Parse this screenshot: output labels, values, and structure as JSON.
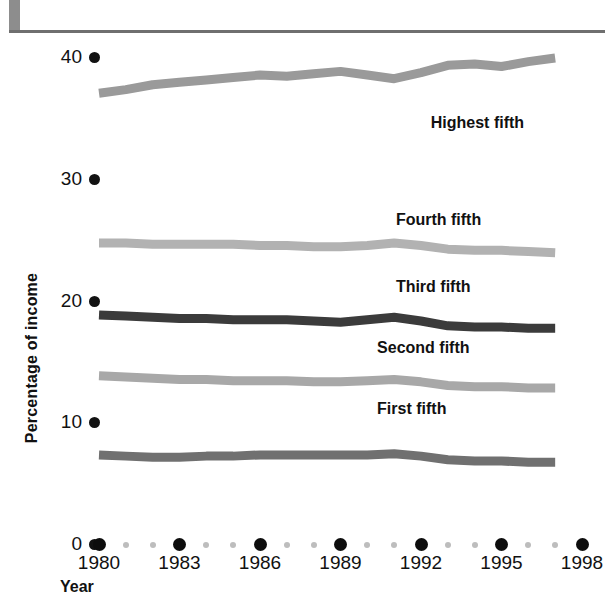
{
  "header": {
    "title": "Income: 1980–1997",
    "accent_color": "#8d8d8d",
    "rule_color": "#6f6f6f"
  },
  "chart_data": {
    "type": "line",
    "title": "Income: 1980–1997",
    "xlabel": "Year",
    "ylabel": "Percentage of income",
    "xlim": [
      1980,
      1998
    ],
    "ylim": [
      0,
      40
    ],
    "grid": false,
    "legend_position": "inline-right",
    "x": [
      1980,
      1981,
      1982,
      1983,
      1984,
      1985,
      1986,
      1987,
      1988,
      1989,
      1990,
      1991,
      1992,
      1993,
      1994,
      1995,
      1996,
      1997
    ],
    "xticks": [
      1980,
      1983,
      1986,
      1989,
      1992,
      1995,
      1998
    ],
    "xticks_minor": [
      1981,
      1982,
      1984,
      1985,
      1987,
      1988,
      1990,
      1991,
      1993,
      1994,
      1996,
      1997
    ],
    "yticks": [
      0,
      10,
      20,
      30,
      40
    ],
    "series": [
      {
        "name": "Highest fifth",
        "color": "#9a9a9a",
        "label_x": 1994.6,
        "label_y": 34.6,
        "values": [
          37.1,
          37.4,
          37.8,
          38.0,
          38.2,
          38.4,
          38.6,
          38.5,
          38.7,
          38.9,
          38.6,
          38.3,
          38.8,
          39.4,
          39.5,
          39.3,
          39.7,
          40.0
        ]
      },
      {
        "name": "Fourth fifth",
        "color": "#b2b2b2",
        "label_x": 1993.3,
        "label_y": 26.6,
        "values": [
          24.8,
          24.8,
          24.7,
          24.7,
          24.7,
          24.7,
          24.6,
          24.6,
          24.5,
          24.5,
          24.6,
          24.8,
          24.6,
          24.3,
          24.2,
          24.2,
          24.1,
          24.0
        ]
      },
      {
        "name": "Third fifth",
        "color": "#3b3b3b",
        "label_x": 1993.3,
        "label_y": 21.1,
        "values": [
          18.9,
          18.8,
          18.7,
          18.6,
          18.6,
          18.5,
          18.5,
          18.5,
          18.4,
          18.3,
          18.5,
          18.7,
          18.4,
          18.0,
          17.9,
          17.9,
          17.8,
          17.8
        ]
      },
      {
        "name": "Second fifth",
        "color": "#a8a8a8",
        "label_x": 1992.6,
        "label_y": 16.1,
        "values": [
          13.9,
          13.8,
          13.7,
          13.6,
          13.6,
          13.5,
          13.5,
          13.5,
          13.4,
          13.4,
          13.5,
          13.6,
          13.4,
          13.1,
          13.0,
          13.0,
          12.9,
          12.9
        ]
      },
      {
        "name": "First fifth",
        "color": "#707070",
        "label_x": 1992.6,
        "label_y": 11.1,
        "values": [
          7.4,
          7.3,
          7.2,
          7.2,
          7.3,
          7.3,
          7.4,
          7.4,
          7.4,
          7.4,
          7.4,
          7.5,
          7.3,
          7.0,
          6.9,
          6.9,
          6.8,
          6.8
        ]
      }
    ]
  }
}
